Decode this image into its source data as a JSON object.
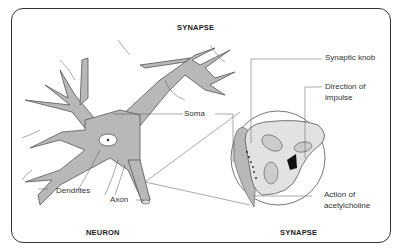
{
  "diagram": {
    "title": "SYNAPSE",
    "left_caption": "NEURON",
    "right_caption": "SYNAPSE",
    "labels": {
      "soma": "Soma",
      "dendrites": "Dendrites",
      "axon": "Axon",
      "synaptic_knob": "Synaptic knob",
      "direction_line1": "Direction of",
      "direction_line2": "impulse",
      "action_line1": "Action of",
      "action_line2": "acetylcholine"
    },
    "colors": {
      "neuron_fill": "#b8b8b8",
      "knob_fill": "#e2e2e2",
      "outline": "#555555",
      "frame": "#333333"
    }
  }
}
